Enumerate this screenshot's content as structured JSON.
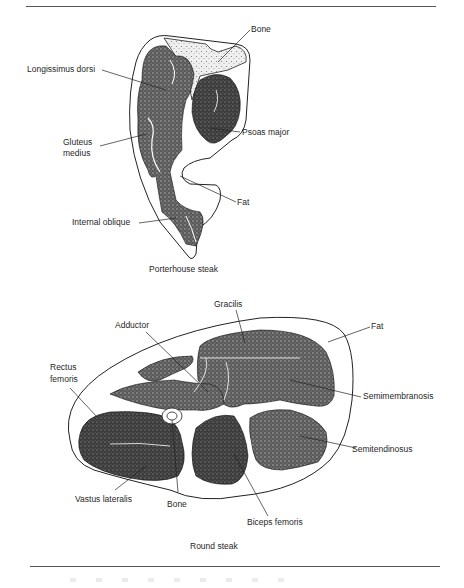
{
  "figure": {
    "panels": [
      {
        "id": "porterhouse",
        "caption": "Porterhouse steak",
        "labels": {
          "bone": "Bone",
          "longissimus_dorsi": "Longissimus dorsi",
          "gluteus_medius_line1": "Gluteus",
          "gluteus_medius_line2": "medius",
          "psoas_major": "Psoas major",
          "fat": "Fat",
          "internal_oblique": "Internal oblique"
        }
      },
      {
        "id": "round",
        "caption": "Round steak",
        "labels": {
          "gracilis": "Gracilis",
          "adductor": "Adductor",
          "fat": "Fat",
          "rectus_femoris_line1": "Rectus",
          "rectus_femoris_line2": "femoris",
          "semimembranosis": "Semimembranosis",
          "semitendinosus": "Semitendinosus",
          "vastus_lateralis": "Vastus lateralis",
          "bone": "Bone",
          "biceps_femoris": "Biceps femoris"
        }
      }
    ],
    "colors": {
      "ink": "#1f1f1f",
      "muscle_fill": "#4a4a4a",
      "bone_fill": "#dcdcdc",
      "background": "#ffffff"
    }
  }
}
